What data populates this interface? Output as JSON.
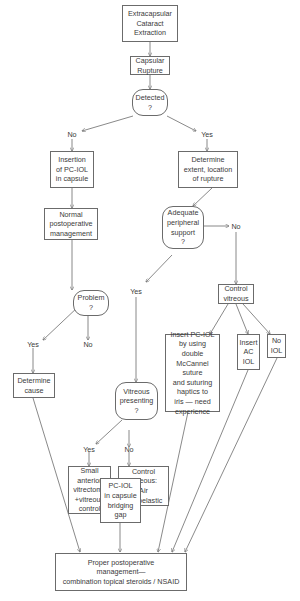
{
  "diagram": {
    "nodes": {
      "ece": {
        "text": "Extracapsular\nCataract\nExtraction",
        "type": "process"
      },
      "rupture": {
        "text": "Capsular\nRupture",
        "type": "process"
      },
      "detected": {
        "text": "Detected\n?",
        "type": "decision"
      },
      "insertion": {
        "text": "Insertion\nof PC-IOL\nin capsule",
        "type": "process"
      },
      "determine_extent": {
        "text": "Determine\nextent, location\nof rupture",
        "type": "process"
      },
      "normal_mgmt": {
        "text": "Normal\npostoperative\nmanagement",
        "type": "process"
      },
      "adequate_support": {
        "text": "Adequate\nperipheral\nsupport\n?",
        "type": "decision"
      },
      "problem": {
        "text": "Problem\n?",
        "type": "decision"
      },
      "control_vitreous": {
        "text": "Control\nvitreous",
        "type": "process"
      },
      "vitreous_presenting": {
        "text": "Vitreous\npresenting\n?",
        "type": "decision"
      },
      "insert_pciol_suture": {
        "text": "Insert PC-IOL\nby using double\nMcCannel suture\nand suturing\nhaptics to\niris — need\nexperience",
        "type": "process"
      },
      "insert_aciol": {
        "text": "Insert\nAC\nIOL",
        "type": "process"
      },
      "no_iol": {
        "text": "No\nIOL",
        "type": "process"
      },
      "determine_cause": {
        "text": "Determine\ncause",
        "type": "process"
      },
      "small_vitrectomy": {
        "text": "Small\nanterior\nvitrectomy\n+vitreous\ncontrol",
        "type": "process"
      },
      "control_vitreous_air": {
        "text": "Control\nvitreous:\nAir\nViscoelastic",
        "type": "process"
      },
      "pciol_bridging": {
        "text": "PC-IOL\nin capsule\nbridging\ngap",
        "type": "process"
      },
      "proper_mgmt": {
        "text": "Proper postoperative\nmanagement—\ncombination topical steroids / NSAID",
        "type": "process"
      }
    },
    "edge_labels": {
      "detected_no": "No",
      "detected_yes": "Yes",
      "support_no": "No",
      "support_yes": "Yes",
      "problem_yes": "Yes",
      "problem_no": "No",
      "vitreous_yes": "Yes",
      "vitreous_no": "No"
    },
    "colors": {
      "line": "#6b6b6b",
      "text": "#3a3a3a",
      "background": "#ffffff"
    }
  }
}
